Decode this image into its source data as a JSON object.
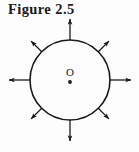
{
  "figure": {
    "caption": "Figure 2.5",
    "type": "physics-diagram"
  },
  "diagram": {
    "center_label": "O",
    "colors": {
      "stroke": "#1a1a1a",
      "background": "#fdfdfd",
      "center_dot": "#1a1a1a"
    },
    "circle": {
      "cx": 70,
      "cy": 80,
      "r": 40,
      "stroke_width": 1.6
    },
    "center_point": {
      "cx": 70,
      "cy": 82,
      "r": 1.9
    },
    "center_label_position": {
      "x": 70,
      "y": 76
    },
    "arrows": [
      {
        "name": "arrow-up",
        "angle_deg": 270,
        "tail_r": 40,
        "head_r": 61,
        "label": "up"
      },
      {
        "name": "arrow-up-right",
        "angle_deg": 315,
        "tail_r": 40,
        "head_r": 55,
        "label": "up-right"
      },
      {
        "name": "arrow-right",
        "angle_deg": 0,
        "tail_r": 40,
        "head_r": 61,
        "label": "right"
      },
      {
        "name": "arrow-down-right",
        "angle_deg": 45,
        "tail_r": 40,
        "head_r": 55,
        "label": "down-right"
      },
      {
        "name": "arrow-down",
        "angle_deg": 90,
        "tail_r": 40,
        "head_r": 61,
        "label": "down"
      },
      {
        "name": "arrow-down-left",
        "angle_deg": 135,
        "tail_r": 40,
        "head_r": 55,
        "label": "down-left"
      },
      {
        "name": "arrow-left",
        "angle_deg": 180,
        "tail_r": 40,
        "head_r": 61,
        "label": "left"
      },
      {
        "name": "arrow-up-left",
        "angle_deg": 225,
        "tail_r": 40,
        "head_r": 55,
        "label": "up-left"
      }
    ]
  }
}
